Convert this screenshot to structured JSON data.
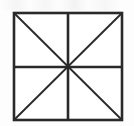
{
  "figure": {
    "name": "divided-square",
    "caption": "",
    "background_color": "#fdfdfd",
    "canvas": {
      "width": 134,
      "height": 126
    }
  },
  "shape": {
    "type": "square",
    "stroke_color": "#2a2a2a",
    "fill_color": "#ffffff",
    "border_width": 2.6,
    "bounds": {
      "left": 14,
      "top": 13,
      "right": 122,
      "bottom": 120
    },
    "size": {
      "width": 108,
      "height": 107
    }
  },
  "divisions": {
    "count": 8,
    "section_shape": "triangle",
    "lines": [
      {
        "name": "vertical-midline",
        "label": "Vertical midline",
        "orientation": "vertical",
        "stroke_color": "#2a2a2a",
        "width": 2.6,
        "x1": 68,
        "y1": 13,
        "x2": 68,
        "y2": 120
      },
      {
        "name": "horizontal-midline",
        "label": "Horizontal midline",
        "orientation": "horizontal",
        "stroke_color": "#2a2a2a",
        "width": 2.6,
        "x1": 14,
        "y1": 67,
        "x2": 122,
        "y2": 67
      },
      {
        "name": "diagonal-tl-br",
        "label": "Diagonal top-left to bottom-right",
        "orientation": "diagonal",
        "stroke_color": "#2a2a2a",
        "width": 1.9,
        "x1": 14,
        "y1": 13,
        "x2": 122,
        "y2": 120
      },
      {
        "name": "diagonal-tr-bl",
        "label": "Diagonal top-right to bottom-left",
        "orientation": "diagonal",
        "stroke_color": "#2a2a2a",
        "width": 1.9,
        "x1": 122,
        "y1": 13,
        "x2": 14,
        "y2": 120
      }
    ]
  },
  "center_point": {
    "name": "center-vertex",
    "x": 68,
    "y": 67
  }
}
